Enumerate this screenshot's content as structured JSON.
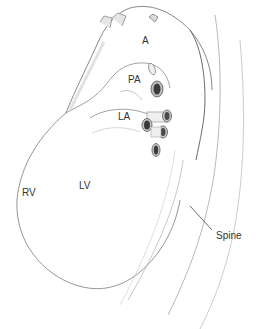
{
  "figure": {
    "type": "anatomical-illustration",
    "labels": [
      {
        "id": "aorta",
        "text": "A",
        "x": 146,
        "y": 38
      },
      {
        "id": "pulmonary-artery",
        "text": "PA",
        "x": 131,
        "y": 77
      },
      {
        "id": "left-atrium",
        "text": "LA",
        "x": 118,
        "y": 113
      },
      {
        "id": "right-ventricle",
        "text": "RV",
        "x": 22,
        "y": 188
      },
      {
        "id": "left-ventricle",
        "text": "LV",
        "x": 79,
        "y": 181
      },
      {
        "id": "spine",
        "text": "Spine",
        "x": 215,
        "y": 232
      }
    ],
    "colors": {
      "line": "#6a6a6a",
      "light_line": "#b8b8b8",
      "shade": "#d8d8d8",
      "vessel_dark": "#3a3a3a",
      "label": "#333333"
    }
  }
}
